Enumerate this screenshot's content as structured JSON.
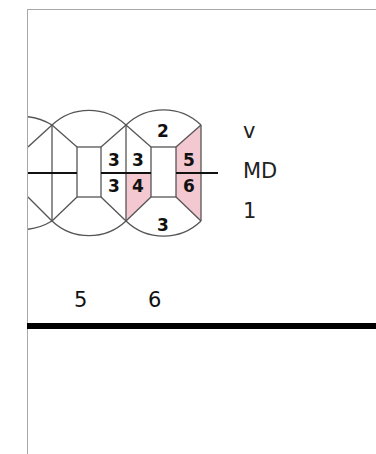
{
  "chart": {
    "colors": {
      "outline": "#555555",
      "highlight": "#f4c8d0",
      "text": "#111111",
      "divider": "#000000"
    },
    "teeth": [
      {
        "number": "5",
        "surfaces": {
          "buccal_top": "",
          "mesial_upper": "",
          "mesial_lower": "",
          "distal_upper": "3",
          "distal_lower": "3",
          "lingual_bottom": ""
        }
      },
      {
        "number": "6",
        "surfaces": {
          "buccal_top": "2",
          "mesial_upper": "3",
          "mesial_lower": "4",
          "distal_upper": "5",
          "distal_lower": "6",
          "lingual_bottom": "3"
        },
        "highlighted": [
          "mesial_lower",
          "distal_upper",
          "distal_lower"
        ]
      }
    ]
  },
  "legend": {
    "row1": "v",
    "row2": "MD",
    "row3": "1"
  }
}
